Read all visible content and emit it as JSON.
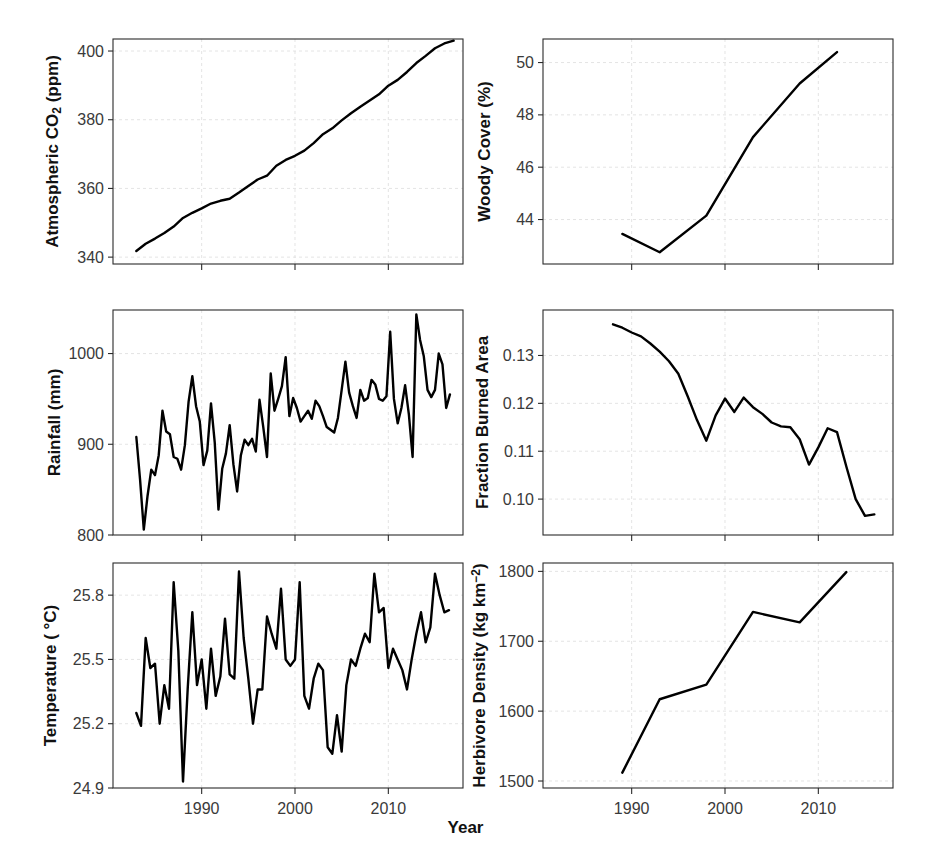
{
  "figure": {
    "xlabel": "Year",
    "background": "#ffffff",
    "line_color": "#000000",
    "grid_color": "#d9d9d9",
    "panel_count": 6,
    "layout": "3 rows x 2 columns"
  },
  "chart_data": [
    {
      "id": "co2",
      "type": "line",
      "title": "",
      "ylabel_html": "Atmospheric  CO<sub>2</sub> (ppm)",
      "ylabel_text": "Atmospheric CO2 (ppm)",
      "xlabel": "Year",
      "grid": true,
      "legend": "none",
      "xlim": [
        1980.5,
        2018.0
      ],
      "ylim": [
        338.0,
        403.5
      ],
      "yticks": [
        340,
        360,
        380,
        400
      ],
      "ytick_labels": [
        "340",
        "360",
        "380",
        "400"
      ],
      "xticks": [
        1990,
        2000,
        2010
      ],
      "xtick_labels": [
        "",
        "",
        ""
      ],
      "x": [
        1983,
        1984,
        1985,
        1986,
        1987,
        1988,
        1989,
        1990,
        1991,
        1992,
        1993,
        1994,
        1995,
        1996,
        1997,
        1998,
        1999,
        2000,
        2001,
        2002,
        2003,
        2004,
        2005,
        2006,
        2007,
        2008,
        2009,
        2010,
        2011,
        2012,
        2013,
        2014,
        2015,
        2016,
        2017
      ],
      "values": [
        341.8,
        343.9,
        345.4,
        347.0,
        348.9,
        351.4,
        352.9,
        354.2,
        355.6,
        356.4,
        357.0,
        358.8,
        360.7,
        362.6,
        363.7,
        366.6,
        368.3,
        369.5,
        371.0,
        373.2,
        375.8,
        377.5,
        379.8,
        381.9,
        383.8,
        385.6,
        387.4,
        389.9,
        391.6,
        393.9,
        396.5,
        398.6,
        400.8,
        402.2,
        403.0
      ],
      "notes": "Monotonic rise, slight inflection at 1999-2000"
    },
    {
      "id": "woody_cover",
      "type": "line",
      "title": "",
      "ylabel_html": "Woody Cover (%)",
      "ylabel_text": "Woody Cover (%)",
      "xlabel": "Year",
      "grid": true,
      "legend": "none",
      "xlim": [
        1980.5,
        2018.0
      ],
      "ylim": [
        42.3,
        50.9
      ],
      "yticks": [
        44,
        46,
        48,
        50
      ],
      "ytick_labels": [
        "44",
        "46",
        "48",
        "50"
      ],
      "xticks": [
        1990,
        2000,
        2010
      ],
      "xtick_labels": [
        "",
        "",
        ""
      ],
      "x": [
        1989,
        1993,
        1998,
        2003,
        2008,
        2012
      ],
      "values": [
        43.45,
        42.75,
        44.15,
        47.15,
        49.2,
        50.4
      ],
      "notes": "Initial dip to 1993 then steep sustained increase"
    },
    {
      "id": "rainfall",
      "type": "line",
      "title": "",
      "ylabel_html": "Rainfall (mm)",
      "ylabel_text": "Rainfall (mm)",
      "xlabel": "Year",
      "grid": true,
      "legend": "none",
      "xlim": [
        1980.5,
        2018.0
      ],
      "ylim": [
        800.0,
        1048.0
      ],
      "yticks": [
        800,
        900,
        1000
      ],
      "ytick_labels": [
        "800",
        "900",
        "1000"
      ],
      "xticks": [
        1990,
        2000,
        2010
      ],
      "xtick_labels": [
        "",
        "",
        ""
      ],
      "x": [
        1983.0,
        1983.4,
        1983.8,
        1984.2,
        1984.6,
        1985.0,
        1985.4,
        1985.8,
        1986.2,
        1986.6,
        1987.0,
        1987.4,
        1987.8,
        1988.2,
        1988.6,
        1989.0,
        1989.4,
        1989.8,
        1990.2,
        1990.6,
        1991.0,
        1991.4,
        1991.8,
        1992.2,
        1992.6,
        1993.0,
        1993.4,
        1993.8,
        1994.2,
        1994.6,
        1995.0,
        1995.4,
        1995.8,
        1996.2,
        1996.6,
        1997.0,
        1997.4,
        1997.8,
        1998.2,
        1998.6,
        1999.0,
        1999.4,
        1999.8,
        2000.2,
        2000.6,
        2001.0,
        2001.4,
        2001.8,
        2002.2,
        2002.6,
        2003.0,
        2003.4,
        2003.8,
        2004.2,
        2004.6,
        2005.0,
        2005.4,
        2005.8,
        2006.2,
        2006.6,
        2007.0,
        2007.4,
        2007.8,
        2008.2,
        2008.6,
        2009.0,
        2009.4,
        2009.8,
        2010.2,
        2010.6,
        2011.0,
        2011.4,
        2011.8,
        2012.2,
        2012.6,
        2013.0,
        2013.4,
        2013.8,
        2014.2,
        2014.6,
        2015.0,
        2015.4,
        2015.8,
        2016.2,
        2016.6,
        2017.0
      ],
      "values": [
        908,
        861,
        806,
        843,
        872,
        866,
        888,
        937,
        914,
        911,
        886,
        884,
        872,
        899,
        947,
        975,
        942,
        925,
        877,
        893,
        945,
        902,
        828,
        873,
        890,
        921,
        878,
        848,
        888,
        905,
        899,
        906,
        892,
        949,
        919,
        886,
        978,
        937,
        950,
        964,
        996,
        931,
        951,
        940,
        925,
        931,
        937,
        928,
        948,
        942,
        931,
        919,
        916,
        913,
        929,
        960,
        991,
        957,
        942,
        929,
        960,
        948,
        951,
        971,
        966,
        950,
        948,
        953,
        1024,
        950,
        923,
        940,
        965,
        933,
        886,
        1043,
        1015,
        997,
        960,
        952,
        960,
        1000,
        988,
        940,
        955
      ],
      "notes": "High-frequency seasonal series with rising baseline; ~2-3 points per year"
    },
    {
      "id": "burned_area",
      "type": "line",
      "title": "",
      "ylabel_html": "Fraction Burned Area",
      "ylabel_text": "Fraction Burned Area",
      "xlabel": "Year",
      "grid": true,
      "legend": "none",
      "xlim": [
        1980.5,
        2018.0
      ],
      "ylim": [
        0.0925,
        0.1395
      ],
      "yticks": [
        0.1,
        0.11,
        0.12,
        0.13
      ],
      "ytick_labels": [
        "0.10",
        "0.11",
        "0.12",
        "0.13"
      ],
      "xticks": [
        1990,
        2000,
        2010
      ],
      "xtick_labels": [
        "",
        "",
        ""
      ],
      "x": [
        1988,
        1989,
        1990,
        1991,
        1992,
        1993,
        1994,
        1995,
        1996,
        1997,
        1998,
        1999,
        2000,
        2001,
        2002,
        2003,
        2004,
        2005,
        2006,
        2007,
        2008,
        2009,
        2010,
        2011,
        2012,
        2013,
        2014,
        2015,
        2016
      ],
      "values": [
        0.1365,
        0.1358,
        0.1348,
        0.134,
        0.1325,
        0.1308,
        0.1288,
        0.1262,
        0.1215,
        0.1165,
        0.1122,
        0.1175,
        0.121,
        0.1182,
        0.1212,
        0.1192,
        0.1178,
        0.116,
        0.1152,
        0.115,
        0.1125,
        0.1072,
        0.1108,
        0.1148,
        0.114,
        0.1068,
        0.1,
        0.0965,
        0.0968
      ],
      "notes": "Long smooth decline to 1998, oscillation 1998-2012, sharp fall to 2015 then flat"
    },
    {
      "id": "temperature",
      "type": "line",
      "title": "",
      "ylabel_html": "Temperature ( °C)",
      "ylabel_text": "Temperature ( °C)",
      "xlabel": "Year",
      "grid": true,
      "legend": "none",
      "xlim": [
        1980.5,
        2018.0
      ],
      "ylim": [
        24.9,
        25.95
      ],
      "yticks": [
        24.9,
        25.2,
        25.5,
        25.8
      ],
      "ytick_labels": [
        "24.9",
        "25.2",
        "25.5",
        "25.8"
      ],
      "xticks": [
        1990,
        2000,
        2010
      ],
      "xtick_labels": [
        "1990",
        "2000",
        "2010"
      ],
      "x": [
        1983.0,
        1983.5,
        1984.0,
        1984.5,
        1985.0,
        1985.5,
        1986.0,
        1986.5,
        1987.0,
        1987.5,
        1988.0,
        1988.5,
        1989.0,
        1989.5,
        1990.0,
        1990.5,
        1991.0,
        1991.5,
        1992.0,
        1992.5,
        1993.0,
        1993.5,
        1994.0,
        1994.5,
        1995.0,
        1995.5,
        1996.0,
        1996.5,
        1997.0,
        1997.5,
        1998.0,
        1998.5,
        1999.0,
        1999.5,
        2000.0,
        2000.5,
        2001.0,
        2001.5,
        2002.0,
        2002.5,
        2003.0,
        2003.5,
        2004.0,
        2004.5,
        2005.0,
        2005.5,
        2006.0,
        2006.5,
        2007.0,
        2007.5,
        2008.0,
        2008.5,
        2009.0,
        2009.5,
        2010.0,
        2010.5,
        2011.0,
        2011.5,
        2012.0,
        2012.5,
        2013.0,
        2013.5,
        2014.0,
        2014.5,
        2015.0,
        2015.5,
        2016.0,
        2016.5
      ],
      "values": [
        25.25,
        25.19,
        25.6,
        25.46,
        25.48,
        25.2,
        25.38,
        25.27,
        25.86,
        25.54,
        24.93,
        25.36,
        25.72,
        25.38,
        25.5,
        25.27,
        25.55,
        25.33,
        25.42,
        25.69,
        25.43,
        25.41,
        25.91,
        25.6,
        25.41,
        25.2,
        25.36,
        25.36,
        25.7,
        25.62,
        25.55,
        25.83,
        25.5,
        25.47,
        25.5,
        25.86,
        25.33,
        25.27,
        25.41,
        25.48,
        25.45,
        25.09,
        25.06,
        25.24,
        25.07,
        25.38,
        25.5,
        25.47,
        25.55,
        25.62,
        25.58,
        25.9,
        25.72,
        25.74,
        25.46,
        25.55,
        25.5,
        25.45,
        25.36,
        25.5,
        25.62,
        25.72,
        25.58,
        25.65,
        25.9,
        25.8,
        25.72,
        25.73
      ],
      "notes": "Strongly variable, ~2 points per year; minimum 24.93 near 1989, maxima ~25.91"
    },
    {
      "id": "herbivore_density",
      "type": "line",
      "title": "",
      "ylabel_html": "Herbivore Density (kg km<sup>−2</sup>)",
      "ylabel_text": "Herbivore Density (kg km-2)",
      "xlabel": "Year",
      "grid": true,
      "legend": "none",
      "xlim": [
        1980.5,
        2018.0
      ],
      "ylim": [
        1490.0,
        1812.0
      ],
      "yticks": [
        1500,
        1600,
        1700,
        1800
      ],
      "ytick_labels": [
        "1500",
        "1600",
        "1700",
        "1800"
      ],
      "xticks": [
        1990,
        2000,
        2010
      ],
      "xtick_labels": [
        "1990",
        "2000",
        "2010"
      ],
      "x": [
        1989,
        1993,
        1998,
        2003,
        2008,
        2013
      ],
      "values": [
        1512,
        1617,
        1638,
        1742,
        1727,
        1799
      ],
      "notes": "Stepwise rise with small dip between 2003 and 2008"
    }
  ]
}
